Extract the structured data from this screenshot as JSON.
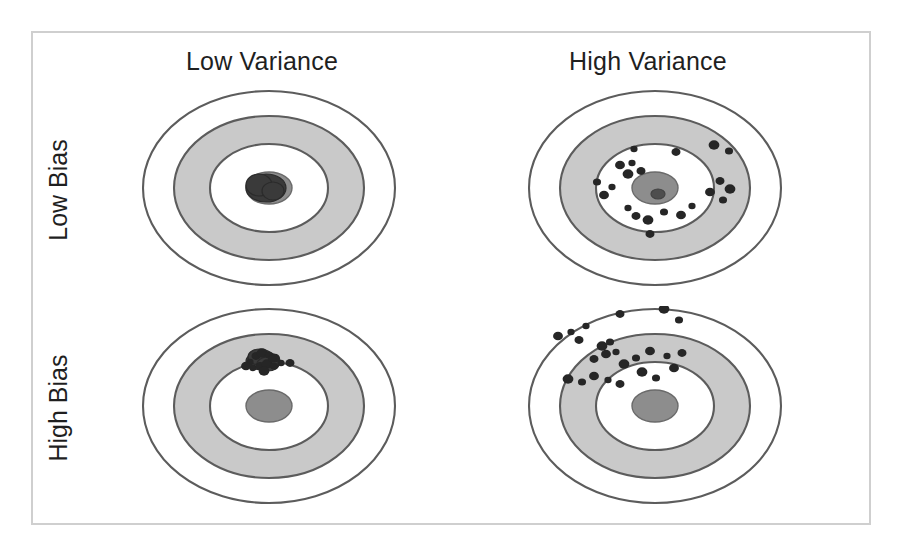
{
  "figure": {
    "background_color": "#ffffff",
    "frame_color": "#cfcfcf"
  },
  "columns": [
    {
      "id": "low-variance",
      "label": "Low Variance"
    },
    {
      "id": "high-variance",
      "label": "High Variance"
    }
  ],
  "rows": [
    {
      "id": "low-bias",
      "label": "Low Bias"
    },
    {
      "id": "high-bias",
      "label": "High Bias"
    }
  ],
  "target_style": {
    "ring_outline_color": "#5c5c5c",
    "gray_band_color": "#c9c9c9",
    "white_band_color": "#ffffff",
    "bullseye_color": "#8d8d8d",
    "shot_color": "#262626",
    "rings": 3,
    "shape": "ellipse"
  },
  "chart_data": {
    "type": "scatter",
    "xlabel": "Variance",
    "ylabel": "Bias",
    "grid": false,
    "legend": false,
    "categories_x": [
      "Low Variance",
      "High Variance"
    ],
    "categories_y": [
      "Low Bias",
      "High Bias"
    ],
    "panels": [
      {
        "id": "low-bias-low-variance",
        "row": "Low Bias",
        "column": "Low Variance",
        "description": "Shots tightly clustered on the bullseye center",
        "shot_count": 1,
        "cluster_center": [
          131,
          100
        ],
        "cluster_spread": [
          8,
          6
        ],
        "points": []
      },
      {
        "id": "low-bias-high-variance",
        "row": "Low Bias",
        "column": "High Variance",
        "description": "Shots spread widely but centered on the bullseye",
        "shot_count": 22,
        "cluster_center": [
          131,
          100
        ],
        "cluster_spread": [
          52,
          36
        ],
        "points": [
          [
            110,
            61
          ],
          [
            152,
            64
          ],
          [
            190,
            57
          ],
          [
            205,
            63
          ],
          [
            96,
            77
          ],
          [
            108,
            75
          ],
          [
            117,
            83
          ],
          [
            104,
            86
          ],
          [
            73,
            94
          ],
          [
            80,
            107
          ],
          [
            88,
            99
          ],
          [
            196,
            93
          ],
          [
            206,
            101
          ],
          [
            199,
            112
          ],
          [
            186,
            104
          ],
          [
            104,
            120
          ],
          [
            112,
            128
          ],
          [
            124,
            132
          ],
          [
            140,
            124
          ],
          [
            157,
            127
          ],
          [
            168,
            118
          ],
          [
            126,
            146
          ]
        ]
      },
      {
        "id": "high-bias-low-variance",
        "row": "High Bias",
        "column": "Low Variance",
        "description": "Shots tightly clustered but offset up from the bullseye",
        "shot_count": 14,
        "cluster_center": [
          124,
          55
        ],
        "cluster_spread": [
          13,
          8
        ],
        "points": [
          [
            112,
            56
          ],
          [
            118,
            50
          ],
          [
            124,
            47
          ],
          [
            131,
            49
          ],
          [
            137,
            52
          ],
          [
            115,
            62
          ],
          [
            122,
            60
          ],
          [
            129,
            58
          ],
          [
            136,
            60
          ],
          [
            108,
            60
          ],
          [
            143,
            57
          ],
          [
            152,
            57
          ],
          [
            126,
            65
          ],
          [
            134,
            53
          ]
        ]
      },
      {
        "id": "high-bias-high-variance",
        "row": "High Bias",
        "column": "High Variance",
        "description": "Shots spread widely and offset up-left from the bullseye",
        "shot_count": 25,
        "cluster_center": [
          100,
          50
        ],
        "cluster_spread": [
          56,
          28
        ],
        "points": [
          [
            62,
            20
          ],
          [
            96,
            8
          ],
          [
            140,
            3
          ],
          [
            155,
            14
          ],
          [
            34,
            30
          ],
          [
            47,
            26
          ],
          [
            55,
            34
          ],
          [
            78,
            40
          ],
          [
            86,
            36
          ],
          [
            82,
            48
          ],
          [
            92,
            46
          ],
          [
            70,
            53
          ],
          [
            100,
            58
          ],
          [
            112,
            52
          ],
          [
            126,
            45
          ],
          [
            143,
            50
          ],
          [
            158,
            47
          ],
          [
            44,
            73
          ],
          [
            58,
            76
          ],
          [
            70,
            70
          ],
          [
            84,
            74
          ],
          [
            96,
            78
          ],
          [
            118,
            66
          ],
          [
            132,
            72
          ],
          [
            150,
            62
          ]
        ]
      }
    ]
  }
}
